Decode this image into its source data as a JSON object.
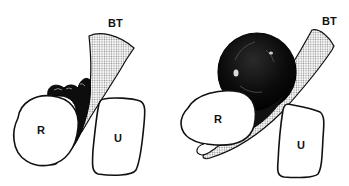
{
  "figure": {
    "panels": [
      {
        "id": "left",
        "labels": {
          "bt": "BT",
          "r": "R",
          "u": "U"
        }
      },
      {
        "id": "right",
        "labels": {
          "bt": "BT",
          "r": "R",
          "u": "U"
        }
      }
    ],
    "colors": {
      "ink": "#111111",
      "background": "#ffffff",
      "stipple": "#9a9a9a"
    }
  }
}
